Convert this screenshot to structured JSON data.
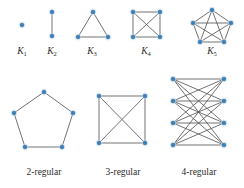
{
  "figure": {
    "background_color": "#ffffff",
    "vertex_color": "#3d7fb8",
    "edge_color": "#585858",
    "label_color": "#2b2b2b"
  },
  "top_row": {
    "graphs": [
      {
        "id": "k1",
        "label": "K",
        "subscript": "1",
        "label_x": 22,
        "label_y": 54,
        "vertices": [
          {
            "x": 22,
            "y": 25
          }
        ],
        "edges": []
      },
      {
        "id": "k2",
        "label": "K",
        "subscript": "2",
        "label_x": 52,
        "label_y": 54,
        "vertices": [
          {
            "x": 52,
            "y": 12
          },
          {
            "x": 52,
            "y": 36
          }
        ],
        "edges": [
          [
            0,
            1
          ]
        ]
      },
      {
        "id": "k3",
        "label": "K",
        "subscript": "3",
        "label_x": 92,
        "label_y": 54,
        "vertices": [
          {
            "x": 93,
            "y": 12
          },
          {
            "x": 78,
            "y": 37
          },
          {
            "x": 108,
            "y": 37
          }
        ],
        "edges": [
          [
            0,
            1
          ],
          [
            0,
            2
          ],
          [
            1,
            2
          ]
        ]
      },
      {
        "id": "k4",
        "label": "K",
        "subscript": "4",
        "label_x": 146,
        "label_y": 54,
        "vertices": [
          {
            "x": 133,
            "y": 12
          },
          {
            "x": 160,
            "y": 12
          },
          {
            "x": 133,
            "y": 37
          },
          {
            "x": 160,
            "y": 37
          }
        ],
        "edges": [
          [
            0,
            1
          ],
          [
            0,
            2
          ],
          [
            0,
            3
          ],
          [
            1,
            2
          ],
          [
            1,
            3
          ],
          [
            2,
            3
          ]
        ]
      },
      {
        "id": "k5",
        "label": "K",
        "subscript": "5",
        "label_x": 212,
        "label_y": 54,
        "vertices": [
          {
            "x": 212,
            "y": 10
          },
          {
            "x": 193,
            "y": 23
          },
          {
            "x": 231,
            "y": 23
          },
          {
            "x": 200,
            "y": 42
          },
          {
            "x": 224,
            "y": 42
          }
        ],
        "edges": [
          [
            0,
            1
          ],
          [
            0,
            2
          ],
          [
            0,
            3
          ],
          [
            0,
            4
          ],
          [
            1,
            2
          ],
          [
            1,
            3
          ],
          [
            1,
            4
          ],
          [
            2,
            3
          ],
          [
            2,
            4
          ],
          [
            3,
            4
          ]
        ]
      }
    ]
  },
  "bottom_row": {
    "graphs": [
      {
        "id": "two-regular",
        "label": "2-regular",
        "label_x": 44,
        "label_y": 175,
        "vertices": [
          {
            "x": 44,
            "y": 92
          },
          {
            "x": 14,
            "y": 113
          },
          {
            "x": 73,
            "y": 113
          },
          {
            "x": 25,
            "y": 147
          },
          {
            "x": 62,
            "y": 147
          }
        ],
        "edges": [
          [
            0,
            1
          ],
          [
            0,
            2
          ],
          [
            1,
            3
          ],
          [
            2,
            4
          ],
          [
            3,
            4
          ]
        ]
      },
      {
        "id": "three-regular",
        "label": "3-regular",
        "label_x": 123,
        "label_y": 175,
        "vertices": [
          {
            "x": 99,
            "y": 96
          },
          {
            "x": 145,
            "y": 96
          },
          {
            "x": 99,
            "y": 143
          },
          {
            "x": 145,
            "y": 143
          }
        ],
        "edges": [
          [
            0,
            1
          ],
          [
            0,
            2
          ],
          [
            0,
            3
          ],
          [
            1,
            2
          ],
          [
            1,
            3
          ],
          [
            2,
            3
          ]
        ]
      },
      {
        "id": "four-regular",
        "label": "4-regular",
        "label_x": 199,
        "label_y": 175,
        "vertices": [
          {
            "x": 173,
            "y": 79
          },
          {
            "x": 173,
            "y": 101
          },
          {
            "x": 173,
            "y": 123
          },
          {
            "x": 173,
            "y": 145
          },
          {
            "x": 224,
            "y": 79
          },
          {
            "x": 224,
            "y": 101
          },
          {
            "x": 224,
            "y": 123
          },
          {
            "x": 224,
            "y": 145
          }
        ],
        "edges": [
          [
            0,
            4
          ],
          [
            0,
            5
          ],
          [
            0,
            6
          ],
          [
            0,
            7
          ],
          [
            1,
            4
          ],
          [
            1,
            5
          ],
          [
            1,
            6
          ],
          [
            1,
            7
          ],
          [
            2,
            4
          ],
          [
            2,
            5
          ],
          [
            2,
            6
          ],
          [
            2,
            7
          ],
          [
            3,
            4
          ],
          [
            3,
            5
          ],
          [
            3,
            6
          ],
          [
            3,
            7
          ]
        ]
      }
    ]
  }
}
